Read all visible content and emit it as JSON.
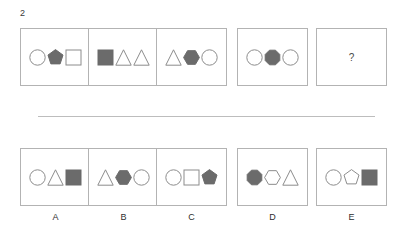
{
  "item": {
    "number": "2",
    "question_placeholder": "?"
  },
  "colors": {
    "fill_gray": "#6b6b6b",
    "stroke_gray": "#8c8c8c",
    "panel_border": "#b3b3b3",
    "background": "#ffffff",
    "divider": "#bdbdbd"
  },
  "sequence": {
    "panels": [
      {
        "name": "panel-1",
        "shapes": [
          {
            "shape": "circle",
            "fill": "white"
          },
          {
            "shape": "pentagon",
            "fill": "gray"
          },
          {
            "shape": "square",
            "fill": "white"
          }
        ]
      },
      {
        "name": "panel-2",
        "shapes": [
          {
            "shape": "square",
            "fill": "gray"
          },
          {
            "shape": "triangle",
            "fill": "white"
          },
          {
            "shape": "triangle",
            "fill": "white"
          }
        ]
      },
      {
        "name": "panel-3",
        "shapes": [
          {
            "shape": "triangle",
            "fill": "white"
          },
          {
            "shape": "hexagon",
            "fill": "gray"
          },
          {
            "shape": "circle",
            "fill": "white"
          }
        ]
      },
      {
        "name": "panel-4",
        "shapes": [
          {
            "shape": "circle",
            "fill": "white"
          },
          {
            "shape": "octagon",
            "fill": "gray"
          },
          {
            "shape": "circle",
            "fill": "white"
          }
        ]
      },
      {
        "name": "panel-5-question",
        "shapes": [],
        "text": "?"
      }
    ]
  },
  "options": {
    "panels": [
      {
        "label": "A",
        "shapes": [
          {
            "shape": "circle",
            "fill": "white"
          },
          {
            "shape": "triangle",
            "fill": "white"
          },
          {
            "shape": "square",
            "fill": "gray"
          }
        ]
      },
      {
        "label": "B",
        "shapes": [
          {
            "shape": "triangle",
            "fill": "white"
          },
          {
            "shape": "hexagon",
            "fill": "gray"
          },
          {
            "shape": "circle",
            "fill": "white"
          }
        ]
      },
      {
        "label": "C",
        "shapes": [
          {
            "shape": "circle",
            "fill": "white"
          },
          {
            "shape": "square",
            "fill": "white"
          },
          {
            "shape": "pentagon",
            "fill": "gray"
          }
        ]
      },
      {
        "label": "D",
        "shapes": [
          {
            "shape": "octagon",
            "fill": "gray"
          },
          {
            "shape": "hexagon",
            "fill": "white"
          },
          {
            "shape": "triangle",
            "fill": "white"
          }
        ]
      },
      {
        "label": "E",
        "shapes": [
          {
            "shape": "circle",
            "fill": "white"
          },
          {
            "shape": "pentagon",
            "fill": "white"
          },
          {
            "shape": "square",
            "fill": "gray"
          }
        ]
      }
    ]
  },
  "layout": {
    "panel_x": [
      20,
      88,
      156,
      237,
      316
    ],
    "panel_width": 71,
    "panel_height": 58
  }
}
